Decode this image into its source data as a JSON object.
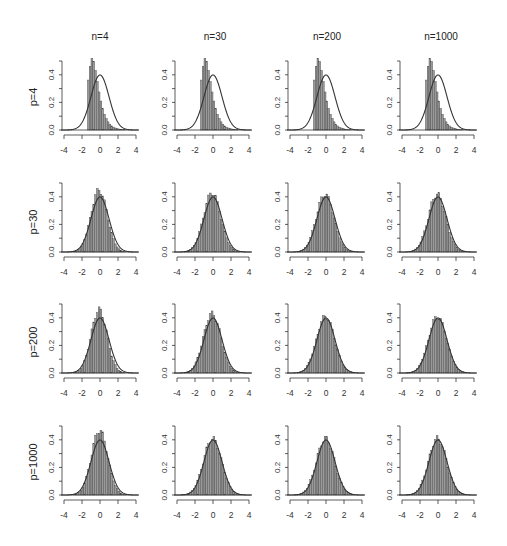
{
  "figure": {
    "col_titles": [
      "n=4",
      "n=30",
      "n=200",
      "n=1000"
    ],
    "row_titles": [
      "p=4",
      "p=30",
      "p=200",
      "p=1000"
    ],
    "colors": {
      "bar_fill": "#9a9a9a",
      "bar_edge": "#444444",
      "curve": "#333333",
      "axis": "#333333",
      "background": "#ffffff"
    }
  },
  "chart_data": {
    "type": "histogram-grid",
    "title": "",
    "rows": 4,
    "cols": 4,
    "row_labels": [
      "p=4",
      "p=30",
      "p=200",
      "p=1000"
    ],
    "col_labels": [
      "n=4",
      "n=30",
      "n=200",
      "n=1000"
    ],
    "xlim": [
      -4.3,
      4.3
    ],
    "ylim": [
      0,
      0.5
    ],
    "x_ticks": [
      -4,
      -2,
      0,
      2,
      4
    ],
    "y_ticks": [
      0.0,
      0.1,
      0.2,
      0.3,
      0.4,
      0.5
    ],
    "y_tick_labels": [
      "0.0",
      "0.2",
      "0.4"
    ],
    "overlay": "standard normal density N(0,1), peak 0.4 at x=0",
    "bin_width": 0.2,
    "panels": [
      {
        "row": "p=4",
        "col": "n=4",
        "shape": "skewed",
        "start": -1.4,
        "peak_x": -0.6,
        "peak": 0.52
      },
      {
        "row": "p=4",
        "col": "n=30",
        "shape": "skewed",
        "start": -1.4,
        "peak_x": -0.6,
        "peak": 0.52
      },
      {
        "row": "p=4",
        "col": "n=200",
        "shape": "skewed",
        "start": -1.4,
        "peak_x": -0.6,
        "peak": 0.52
      },
      {
        "row": "p=4",
        "col": "n=1000",
        "shape": "skewed",
        "start": -1.4,
        "peak_x": -0.6,
        "peak": 0.52
      },
      {
        "row": "p=30",
        "col": "n=4",
        "shape": "normal",
        "sd": 0.9,
        "mean": -0.1,
        "peak": 0.45
      },
      {
        "row": "p=30",
        "col": "n=30",
        "shape": "normal",
        "sd": 0.95,
        "mean": -0.1,
        "peak": 0.43
      },
      {
        "row": "p=30",
        "col": "n=200",
        "shape": "normal",
        "sd": 0.97,
        "mean": -0.1,
        "peak": 0.42
      },
      {
        "row": "p=30",
        "col": "n=1000",
        "shape": "normal",
        "sd": 0.97,
        "mean": -0.1,
        "peak": 0.42
      },
      {
        "row": "p=200",
        "col": "n=4",
        "shape": "normal",
        "sd": 0.88,
        "mean": -0.1,
        "peak": 0.46
      },
      {
        "row": "p=200",
        "col": "n=30",
        "shape": "normal",
        "sd": 0.97,
        "mean": -0.1,
        "peak": 0.43
      },
      {
        "row": "p=200",
        "col": "n=200",
        "shape": "normal",
        "sd": 1.0,
        "mean": -0.05,
        "peak": 0.41
      },
      {
        "row": "p=200",
        "col": "n=1000",
        "shape": "normal",
        "sd": 1.0,
        "mean": -0.05,
        "peak": 0.41
      },
      {
        "row": "p=1000",
        "col": "n=4",
        "shape": "normal",
        "sd": 0.9,
        "mean": -0.05,
        "peak": 0.47
      },
      {
        "row": "p=1000",
        "col": "n=30",
        "shape": "normal",
        "sd": 1.0,
        "mean": -0.05,
        "peak": 0.41
      },
      {
        "row": "p=1000",
        "col": "n=200",
        "shape": "normal",
        "sd": 1.0,
        "mean": -0.05,
        "peak": 0.41
      },
      {
        "row": "p=1000",
        "col": "n=1000",
        "shape": "normal",
        "sd": 1.0,
        "mean": -0.05,
        "peak": 0.41
      }
    ]
  },
  "layout": {
    "col_yaxis_x": [
      62,
      175,
      288,
      400
    ],
    "row_baseline_y": [
      130,
      252,
      373,
      495
    ],
    "col_title_x": [
      100,
      215,
      327,
      441
    ],
    "col_title_y": 31,
    "row_title_x": 33,
    "px_per_unit_x": 9,
    "px_per_unit_y": 138
  }
}
